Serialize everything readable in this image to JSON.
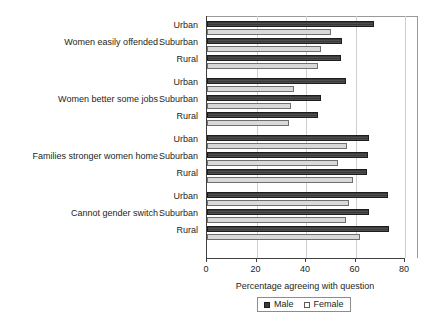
{
  "chart_data": {
    "type": "bar",
    "orientation": "horizontal",
    "title": "",
    "xlabel": "Percentage agreeing with question",
    "ylabel": "",
    "xlim": [
      0,
      80
    ],
    "xticks": [
      0,
      20,
      40,
      60,
      80
    ],
    "grid": true,
    "legend_position": "bottom",
    "categories": [
      "Women easily offended",
      "Women better some jobs",
      "Families stronger women home",
      "Cannot gender switch"
    ],
    "subcategories": [
      "Urban",
      "Suburban",
      "Rural"
    ],
    "series": [
      {
        "name": "Male",
        "color": "#3a3a3a",
        "values": {
          "Women easily offended": {
            "Urban": 67.5,
            "Suburban": 54.5,
            "Rural": 54.0
          },
          "Women better some jobs": {
            "Urban": 56.0,
            "Suburban": 46.0,
            "Rural": 45.0
          },
          "Families stronger women home": {
            "Urban": 65.5,
            "Suburban": 65.0,
            "Rural": 64.5
          },
          "Cannot gender switch": {
            "Urban": 73.0,
            "Suburban": 65.5,
            "Rural": 73.5
          }
        }
      },
      {
        "name": "Female",
        "color": "#d9d9d9",
        "values": {
          "Women easily offended": {
            "Urban": 50.0,
            "Suburban": 46.0,
            "Rural": 45.0
          },
          "Women better some jobs": {
            "Urban": 35.0,
            "Suburban": 34.0,
            "Rural": 33.0
          },
          "Families stronger women home": {
            "Urban": 56.5,
            "Suburban": 53.0,
            "Rural": 59.0
          },
          "Cannot gender switch": {
            "Urban": 57.5,
            "Suburban": 56.0,
            "Rural": 62.0
          }
        }
      }
    ]
  },
  "axis": {
    "x_title": "Percentage agreeing with question",
    "ticks": [
      {
        "value": 0,
        "label": "0"
      },
      {
        "value": 20,
        "label": "20"
      },
      {
        "value": 40,
        "label": "40"
      },
      {
        "value": 60,
        "label": "60"
      },
      {
        "value": 80,
        "label": "80"
      }
    ]
  },
  "legend": {
    "items": [
      {
        "label": "Male",
        "swatch": "filled-dark-square"
      },
      {
        "label": "Female",
        "swatch": "empty-light-square"
      }
    ]
  },
  "groups": [
    {
      "name": "Women easily offended",
      "rows": [
        {
          "label": "Urban",
          "male": 67.5,
          "female": 50.0
        },
        {
          "label": "Suburban",
          "male": 54.5,
          "female": 46.0
        },
        {
          "label": "Rural",
          "male": 54.0,
          "female": 45.0
        }
      ]
    },
    {
      "name": "Women better some jobs",
      "rows": [
        {
          "label": "Urban",
          "male": 56.0,
          "female": 35.0
        },
        {
          "label": "Suburban",
          "male": 46.0,
          "female": 34.0
        },
        {
          "label": "Rural",
          "male": 45.0,
          "female": 33.0
        }
      ]
    },
    {
      "name": "Families stronger women home",
      "rows": [
        {
          "label": "Urban",
          "male": 65.5,
          "female": 56.5
        },
        {
          "label": "Suburban",
          "male": 65.0,
          "female": 53.0
        },
        {
          "label": "Rural",
          "male": 64.5,
          "female": 59.0
        }
      ]
    },
    {
      "name": "Cannot gender switch",
      "rows": [
        {
          "label": "Urban",
          "male": 73.0,
          "female": 57.5
        },
        {
          "label": "Suburban",
          "male": 65.5,
          "female": 56.0
        },
        {
          "label": "Rural",
          "male": 73.5,
          "female": 62.0
        }
      ]
    }
  ]
}
